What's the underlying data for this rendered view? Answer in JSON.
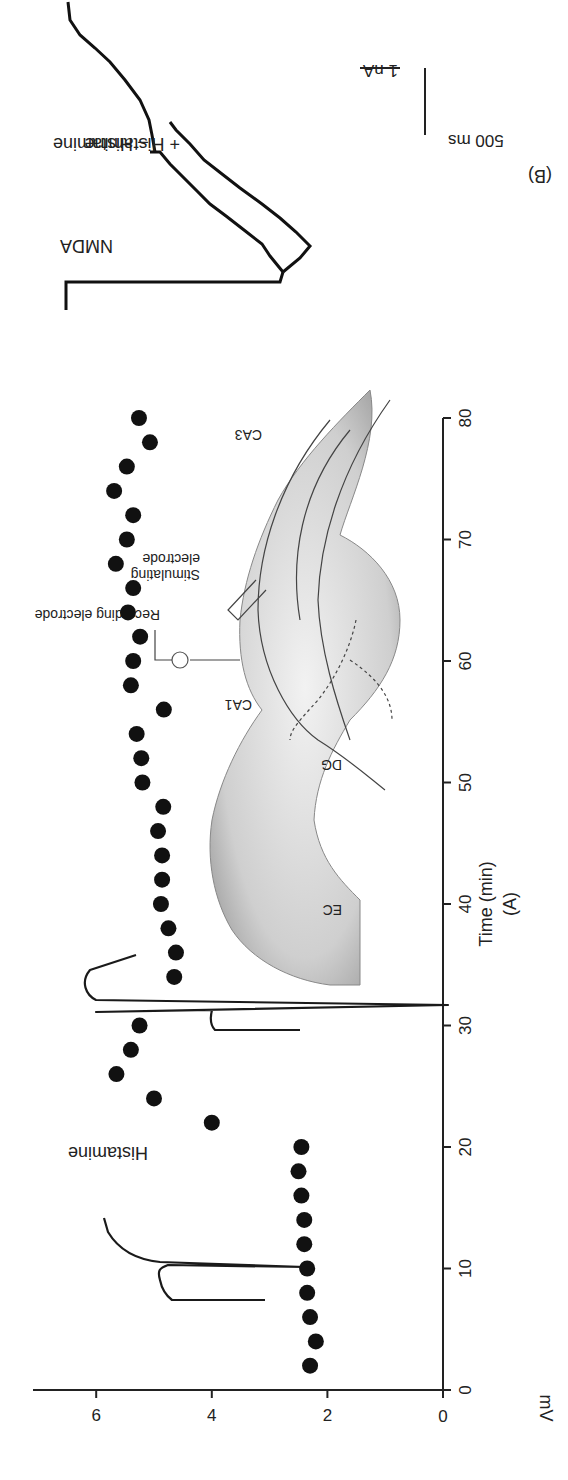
{
  "panel_a": {
    "label": "(A)",
    "annotation": "Histamine",
    "inset": {
      "recording_label": "Recording electrode",
      "stimulating_label_line1": "Stimulating",
      "stimulating_label_line2": "electrode",
      "region_ca1": "CA1",
      "region_ca3": "CA3",
      "region_dg": "DG",
      "region_ec": "EC"
    }
  },
  "panel_b": {
    "label": "(B)",
    "title": "NMDA",
    "legend_minus": "– Histamine",
    "legend_plus": "+ Histamine",
    "scale_current": "1 nA",
    "scale_time": "500 ms"
  },
  "chart_data": [
    {
      "type": "scatter",
      "title": "",
      "panel": "A",
      "xlabel": "Time (min)",
      "ylabel": "mV",
      "xlim": [
        0,
        80
      ],
      "ylim": [
        0,
        7
      ],
      "xticks": [
        0,
        10,
        20,
        30,
        40,
        50,
        60,
        70,
        80
      ],
      "yticks": [
        0,
        2,
        4,
        6
      ],
      "grid": false,
      "annotation": "Histamine (applied ~20-22 min)",
      "series": [
        {
          "name": "fEPSP amplitude",
          "x": [
            2,
            4,
            6,
            8,
            10,
            12,
            14,
            16,
            18,
            20,
            22,
            24,
            26,
            28,
            30,
            34,
            36,
            38,
            40,
            42,
            44,
            46,
            48,
            50,
            52,
            54,
            56,
            58,
            60,
            62,
            64,
            66,
            68,
            70,
            72,
            74,
            76,
            78,
            80
          ],
          "y": [
            2.3,
            2.2,
            2.3,
            2.35,
            2.35,
            2.4,
            2.4,
            2.45,
            2.5,
            2.45,
            4.0,
            5.0,
            5.65,
            5.4,
            5.25,
            4.65,
            4.62,
            4.75,
            4.88,
            4.86,
            4.86,
            4.93,
            4.84,
            5.2,
            5.22,
            5.3,
            4.83,
            5.4,
            5.36,
            5.24,
            5.45,
            5.36,
            5.66,
            5.47,
            5.36,
            5.69,
            5.47,
            5.07,
            5.26
          ]
        }
      ]
    },
    {
      "type": "line",
      "panel": "B",
      "title": "NMDA",
      "xlabel": "",
      "ylabel": "",
      "series": [
        {
          "name": "– Histamine",
          "description": "inward NMDA current, smaller peak"
        },
        {
          "name": "+ Histamine",
          "description": "inward NMDA current, larger peak"
        }
      ],
      "scale_bars": {
        "current": "1 nA",
        "time": "500 ms"
      }
    }
  ]
}
